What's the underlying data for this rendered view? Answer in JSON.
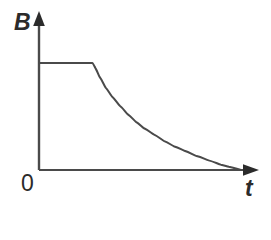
{
  "figure": {
    "title": "",
    "background_color": "#ffffff",
    "line_color": "#4a4a4a",
    "label_color": "#2b2b2b",
    "axis_line_width": 2
  },
  "labels": {
    "y_axis": "B",
    "x_axis": "t",
    "origin": "0"
  },
  "icons": {
    "y_arrow": "arrow-up-icon",
    "x_arrow": "arrow-right-icon"
  },
  "chart_data": {
    "type": "line",
    "title": "",
    "xlabel": "t",
    "ylabel": "B",
    "grid": false,
    "legend": null,
    "xlim": [
      0,
      1
    ],
    "ylim": [
      0,
      1.15
    ],
    "axis_style": "arrow-axes",
    "tick_labels": {
      "x": [],
      "y": []
    },
    "annotations": [
      {
        "text": "0",
        "x": 0,
        "y": 0,
        "position": "origin"
      }
    ],
    "series": [
      {
        "name": "B(t)",
        "description": "Constant plateau then exponential decay toward zero",
        "color": "#4a4a4a",
        "x": [
          0.0,
          0.05,
          0.1,
          0.15,
          0.2,
          0.25,
          0.265,
          0.28,
          0.3,
          0.33,
          0.36,
          0.4,
          0.44,
          0.48,
          0.52,
          0.57,
          0.62,
          0.67,
          0.72,
          0.78,
          0.84,
          0.9,
          0.94,
          1.0
        ],
        "y": [
          1.0,
          1.0,
          1.0,
          1.0,
          1.0,
          1.0,
          1.0,
          0.95,
          0.87,
          0.77,
          0.69,
          0.6,
          0.52,
          0.45,
          0.39,
          0.33,
          0.27,
          0.22,
          0.18,
          0.13,
          0.09,
          0.05,
          0.03,
          0.0
        ]
      }
    ],
    "features": {
      "plateau_value": 1.0,
      "plateau_end_x": 0.265,
      "decay_shape": "exponential",
      "final_value": 0.0
    }
  }
}
